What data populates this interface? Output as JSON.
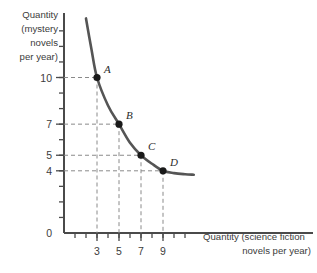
{
  "chart_data": {
    "type": "line",
    "title": "",
    "subtitle": "",
    "xlabel_line1": "Quantity (science fiction",
    "xlabel_line2": "novels per year)",
    "ylabel_line1": "Quantity",
    "ylabel_line2": "(mystery",
    "ylabel_line3": "novels",
    "ylabel_line4": "per year)",
    "origin_label": "0",
    "xlim": [
      0,
      12
    ],
    "ylim": [
      0,
      14
    ],
    "grid": false,
    "legend": "none",
    "x_tick_labels": [
      "3",
      "5",
      "7",
      "9"
    ],
    "x_tick_values": [
      3,
      5,
      7,
      9
    ],
    "x_minor_ticks": [
      1,
      2,
      3,
      4,
      5,
      6,
      7,
      8,
      9,
      10,
      11
    ],
    "y_tick_labels": [
      "10",
      "7",
      "5",
      "4"
    ],
    "y_tick_values": [
      10,
      7,
      5,
      4
    ],
    "y_minor_ticks": [
      1,
      2,
      3,
      4,
      5,
      6,
      7,
      8,
      9,
      10,
      11,
      12,
      13
    ],
    "series": [
      {
        "name": "indifference-curve",
        "color": "#555555",
        "x": [
          2.0,
          2.5,
          3.0,
          4.0,
          5.0,
          6.0,
          7.0,
          8.0,
          9.0,
          10.0,
          11.0,
          11.8
        ],
        "values": [
          13.8,
          11.8,
          10.0,
          8.2,
          7.0,
          5.8,
          5.0,
          4.45,
          4.0,
          3.85,
          3.78,
          3.75
        ]
      }
    ],
    "points": [
      {
        "label": "A",
        "x": 3,
        "y": 10
      },
      {
        "label": "B",
        "x": 5,
        "y": 7
      },
      {
        "label": "C",
        "x": 7,
        "y": 5
      },
      {
        "label": "D",
        "x": 9,
        "y": 4
      }
    ]
  }
}
